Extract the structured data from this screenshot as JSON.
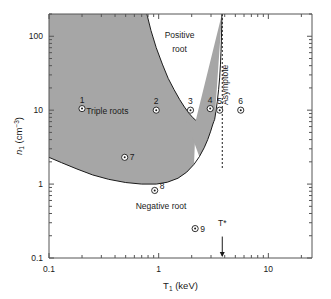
{
  "chart_data": {
    "type": "scatter",
    "title": "",
    "xlabel": "T₁ (keV)",
    "ylabel": "n₁ (cm⁻³)",
    "xscale": "log",
    "yscale": "log",
    "xlim": [
      0.1,
      25
    ],
    "ylim": [
      0.1,
      200
    ],
    "grid": false,
    "legend": "none",
    "x_tick_labels": [
      "0.1",
      "1",
      "10"
    ],
    "x_tick_values": [
      0.1,
      1,
      10
    ],
    "y_tick_labels": [
      "0.1",
      "1",
      "10",
      "100"
    ],
    "y_tick_values": [
      0.1,
      1,
      10,
      100
    ],
    "annotations": [
      {
        "text": "Positive",
        "x": 1.55,
        "y": 95,
        "kind": "region-label"
      },
      {
        "text": "root",
        "x": 1.55,
        "y": 62,
        "kind": "region-label"
      },
      {
        "text": "Triple roots",
        "x": 0.34,
        "y": 9.0,
        "kind": "region-label"
      },
      {
        "text": "Negative root",
        "x": 1.05,
        "y": 0.46,
        "kind": "region-label"
      },
      {
        "text": "Asymptote",
        "x": 4.3,
        "y": 22,
        "kind": "rotated-label"
      },
      {
        "text": "T*",
        "x": 3.8,
        "y": 0.27,
        "kind": "marker-label"
      }
    ],
    "asymptote": {
      "x": 3.8,
      "style": "dashed",
      "label": "Asymptote"
    },
    "tstar_arrow": {
      "x": 3.8,
      "label": "T*"
    },
    "shaded_region": {
      "label": "Triple roots",
      "fill": "#a6a6a6",
      "edge": "#1a1a1a"
    },
    "points": [
      {
        "label": "1",
        "x": 0.2,
        "y": 10.5
      },
      {
        "label": "2",
        "x": 0.95,
        "y": 10.0
      },
      {
        "label": "3",
        "x": 1.95,
        "y": 10.0
      },
      {
        "label": "4",
        "x": 2.95,
        "y": 10.5
      },
      {
        "label": "5",
        "x": 3.6,
        "y": 10.0
      },
      {
        "label": "6",
        "x": 5.6,
        "y": 10.0
      },
      {
        "label": "7",
        "x": 0.49,
        "y": 2.3
      },
      {
        "label": "8",
        "x": 0.92,
        "y": 0.82
      },
      {
        "label": "9",
        "x": 2.15,
        "y": 0.25
      }
    ]
  },
  "colors": {
    "shade": "#a6a6a6",
    "axis": "#555555",
    "curve": "#1a1a1a",
    "text": "#1a1a1a"
  }
}
